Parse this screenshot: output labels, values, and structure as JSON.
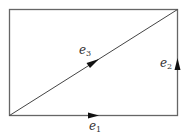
{
  "diagram": {
    "type": "rectangle-with-diagonal",
    "stroke_color": "#555555",
    "background": "#ffffff",
    "edges": [
      {
        "id": "e1",
        "base": "e",
        "sub": "1",
        "from": "bottom-left",
        "to": "bottom-right",
        "direction": "right"
      },
      {
        "id": "e2",
        "base": "e",
        "sub": "2",
        "from": "bottom-right",
        "to": "top-right",
        "direction": "up"
      },
      {
        "id": "e3",
        "base": "e",
        "sub": "3",
        "from": "bottom-left",
        "to": "top-right",
        "direction": "up-right"
      }
    ]
  }
}
